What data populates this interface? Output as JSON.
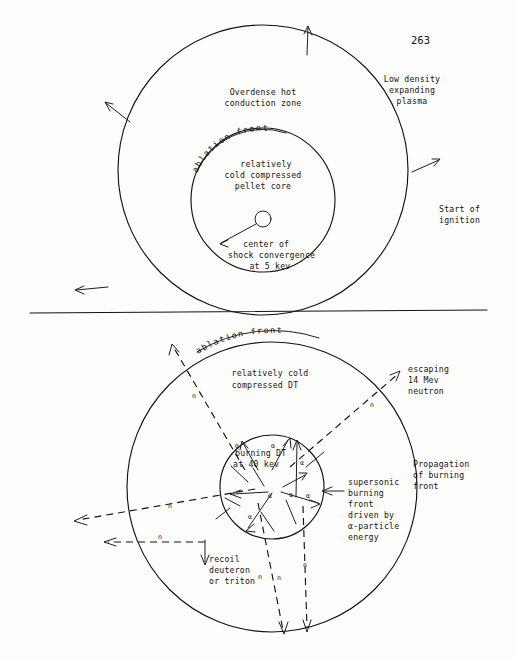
{
  "page": {
    "number": "263"
  },
  "figures": {
    "top": {
      "name": "start-of-ignition-figure",
      "labels": {
        "outer_zone": [
          "Overdense hot",
          "conduction zone"
        ],
        "plasma": [
          "Low density",
          "expanding",
          "plasma"
        ],
        "ignition": [
          "Start of",
          "ignition"
        ],
        "ablation_front": "ablation front",
        "core": [
          "relatively",
          "cold compressed",
          "pellet core"
        ],
        "center": [
          "center of",
          "shock convergence",
          "at 5 kev"
        ]
      }
    },
    "bottom": {
      "name": "propagation-of-burning-front-figure",
      "labels": {
        "ablation_front": "ablation front",
        "cold_dt": [
          "relatively cold",
          "compressed DT"
        ],
        "escaping_neutron": [
          "escaping",
          "14 Mev",
          "neutron"
        ],
        "propagation": [
          "Propagation",
          "of burning",
          "front"
        ],
        "burning_core": [
          "burning DT",
          "at 40 kev"
        ],
        "supersonic": [
          "supersonic",
          "burning",
          "front",
          "driven by",
          "α-particle",
          "energy"
        ],
        "recoil": [
          "recoil",
          "deuteron",
          "or triton"
        ],
        "neutron_marks": [
          "n",
          "n",
          "n",
          "n",
          "n",
          "n",
          "n"
        ],
        "alpha_marks": [
          "α",
          "α",
          "α",
          "α",
          "α",
          "α",
          "α"
        ]
      }
    }
  },
  "colors": {
    "ink": "#16130f",
    "paper": "#fdfdfb"
  }
}
